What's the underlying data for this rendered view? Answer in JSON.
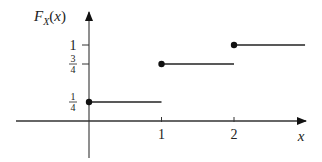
{
  "chart_data": {
    "type": "line",
    "subtype": "step-cdf",
    "title": "",
    "ylabel": "F_X(x)",
    "ylabel_display": {
      "main": "F",
      "sub": "X",
      "arg": "(x)"
    },
    "xlabel": "x",
    "x_ticks": [
      {
        "value": 1,
        "label": "1"
      },
      {
        "value": 2,
        "label": "2"
      }
    ],
    "y_ticks": [
      {
        "value": 0.25,
        "num": "1",
        "den": "4",
        "label": "1/4",
        "tick": false
      },
      {
        "value": 0.75,
        "num": "3",
        "den": "4",
        "label": "3/4",
        "tick": true
      },
      {
        "value": 1,
        "label": "1",
        "tick": true
      }
    ],
    "segments": [
      {
        "x_start": 0,
        "x_end": 1,
        "y": 0.25,
        "closed_left": true
      },
      {
        "x_start": 1,
        "x_end": 2,
        "y": 0.75,
        "closed_left": true
      },
      {
        "x_start": 2,
        "x_end": 2.98,
        "y": 1,
        "closed_left": true
      }
    ],
    "xlim": [
      -1,
      3
    ],
    "ylim": [
      -0.4,
      1.45
    ],
    "grid": false,
    "legend": null,
    "colors": {
      "line": "#222222",
      "axis": "#333333",
      "dot": "#111111"
    }
  }
}
